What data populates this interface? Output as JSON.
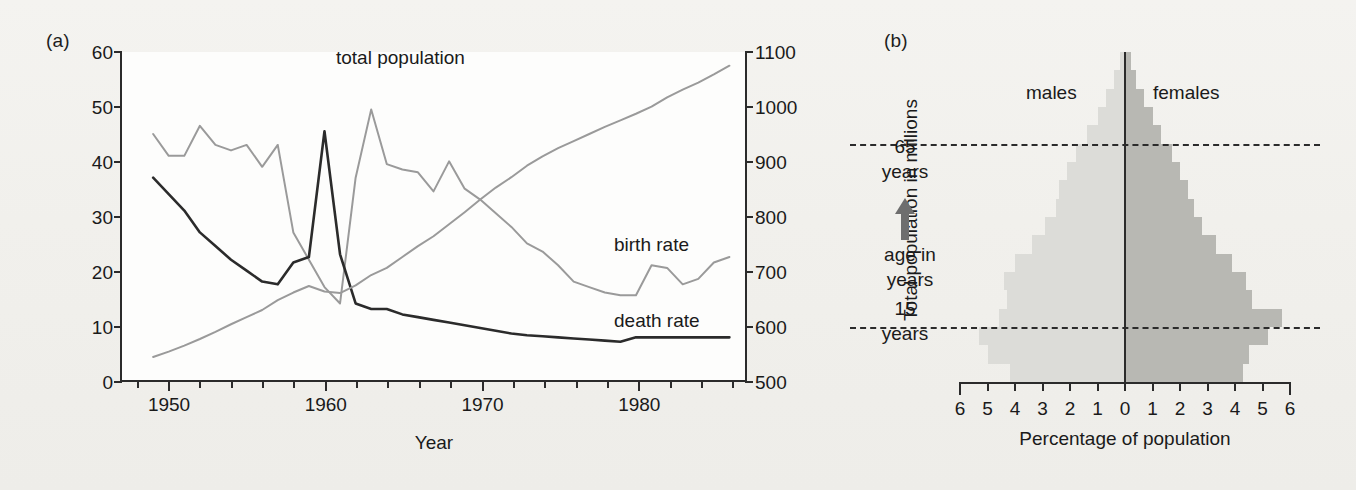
{
  "figure": {
    "panel_a_label": "(a)",
    "panel_b_label": "(b)"
  },
  "panel_a": {
    "y_left_title": "Births and deaths per 1000",
    "y_right_title": "Total population in millions",
    "x_title": "Year",
    "y_left_ticks": [
      "0",
      "10",
      "20",
      "30",
      "40",
      "50",
      "60"
    ],
    "y_right_ticks": [
      "500",
      "600",
      "700",
      "800",
      "900",
      "1000",
      "1100"
    ],
    "x_ticks": [
      "1950",
      "1960",
      "1970",
      "1980"
    ],
    "annotations": {
      "total_population": "total population",
      "birth_rate": "birth rate",
      "death_rate": "death rate"
    }
  },
  "panel_b": {
    "males_label": "males",
    "females_label": "females",
    "age_axis_label_line1": "age in",
    "age_axis_label_line2": "years",
    "marker_65_line1": "65",
    "marker_65_line2": "years",
    "marker_15_line1": "15",
    "marker_15_line2": "years",
    "x_title": "Percentage of population",
    "x_ticks": [
      "6",
      "5",
      "4",
      "3",
      "2",
      "1",
      "0",
      "1",
      "2",
      "3",
      "4",
      "5",
      "6"
    ]
  },
  "colors": {
    "axis": "#2b2b2b",
    "death_rate_line": "#2b2b2b",
    "birth_rate_line": "#9a9a9a",
    "total_population_line": "#9a9a9a",
    "male_bar": "#dcdcd8",
    "female_bar": "#b8b8b3",
    "background": "#f2f1ee",
    "plot_background": "#fdfdfc"
  },
  "chart_data": [
    {
      "type": "line",
      "id": "panel-a",
      "title": "",
      "xlabel": "Year",
      "ylabel": "Births and deaths per 1000",
      "ylabel_secondary": "Total population in millions",
      "xlim": [
        1947,
        1987
      ],
      "ylim": [
        0,
        60
      ],
      "ylim_secondary": [
        500,
        1100
      ],
      "grid": false,
      "legend": "inline annotations",
      "x": [
        1949,
        1950,
        1951,
        1952,
        1953,
        1954,
        1955,
        1956,
        1957,
        1958,
        1959,
        1960,
        1961,
        1962,
        1963,
        1964,
        1965,
        1966,
        1967,
        1968,
        1969,
        1970,
        1971,
        1972,
        1973,
        1974,
        1975,
        1976,
        1977,
        1978,
        1979,
        1980,
        1981,
        1982,
        1983,
        1984,
        1985,
        1986
      ],
      "series": [
        {
          "name": "birth rate",
          "axis": "left",
          "color": "#9a9a9a",
          "units": "per 1000",
          "values": [
            45.0,
            41.0,
            41.0,
            46.5,
            43.0,
            42.0,
            43.0,
            39.0,
            43.0,
            27.0,
            22.0,
            17.0,
            14.0,
            37.0,
            49.5,
            39.5,
            38.5,
            38.0,
            34.5,
            40.0,
            35.0,
            33.0,
            30.5,
            28.0,
            25.0,
            23.5,
            21.0,
            18.0,
            17.0,
            16.0,
            15.5,
            15.5,
            21.0,
            20.5,
            17.5,
            18.5,
            21.5,
            22.5
          ]
        },
        {
          "name": "death rate",
          "axis": "left",
          "color": "#2b2b2b",
          "units": "per 1000",
          "values": [
            37.0,
            34.0,
            31.0,
            27.0,
            24.5,
            22.0,
            20.0,
            18.0,
            17.5,
            21.5,
            22.5,
            45.5,
            23.0,
            14.0,
            13.0,
            13.0,
            12.0,
            11.5,
            11.0,
            10.5,
            10.0,
            9.5,
            9.0,
            8.5,
            8.2,
            8.0,
            7.8,
            7.6,
            7.4,
            7.2,
            7.0,
            7.8,
            7.8,
            7.8,
            7.8,
            7.8,
            7.8,
            7.8
          ]
        },
        {
          "name": "total population",
          "axis": "right",
          "color": "#9a9a9a",
          "units": "millions",
          "values": [
            542,
            552,
            563,
            575,
            588,
            602,
            615,
            628,
            646,
            660,
            672,
            662,
            659,
            673,
            692,
            705,
            725,
            745,
            763,
            785,
            807,
            830,
            852,
            871,
            892,
            909,
            924,
            937,
            950,
            963,
            975,
            987,
            1000,
            1017,
            1031,
            1044,
            1059,
            1075
          ]
        }
      ]
    },
    {
      "type": "bar",
      "id": "panel-b",
      "orientation": "population-pyramid",
      "title": "",
      "xlabel": "Percentage of population",
      "ylabel": "age in years",
      "xlim": [
        -6,
        6
      ],
      "grid": false,
      "age_groups": [
        "0-4",
        "5-9",
        "10-14",
        "15-19",
        "20-24",
        "25-29",
        "30-34",
        "35-39",
        "40-44",
        "45-49",
        "50-54",
        "55-59",
        "60-64",
        "65-69",
        "70-74",
        "75-79",
        "80-84",
        "85+"
      ],
      "reference_lines": [
        15,
        65
      ],
      "series": [
        {
          "name": "males",
          "color": "#dcdcd8",
          "side": "left",
          "values": [
            4.2,
            5.0,
            5.3,
            4.6,
            4.3,
            4.4,
            4.0,
            3.4,
            2.9,
            2.5,
            2.4,
            2.1,
            1.8,
            1.4,
            1.0,
            0.7,
            0.4,
            0.2
          ]
        },
        {
          "name": "females",
          "color": "#b8b8b3",
          "side": "right",
          "values": [
            4.3,
            4.5,
            5.2,
            5.7,
            4.6,
            4.4,
            3.9,
            3.3,
            2.8,
            2.5,
            2.3,
            2.0,
            1.7,
            1.3,
            1.0,
            0.7,
            0.4,
            0.2
          ]
        }
      ]
    }
  ]
}
